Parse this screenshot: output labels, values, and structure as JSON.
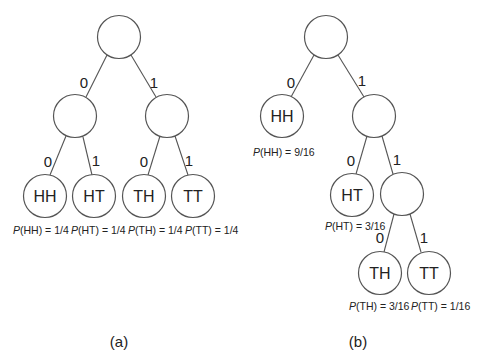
{
  "diagram_a": {
    "caption": "(a)",
    "edges": [
      {
        "label": "0"
      },
      {
        "label": "1"
      },
      {
        "label": "0"
      },
      {
        "label": "1"
      },
      {
        "label": "0"
      },
      {
        "label": "1"
      }
    ],
    "leaves": [
      {
        "label": "HH",
        "prob_p": "P",
        "prob_rest": "(HH) = 1/4"
      },
      {
        "label": "HT",
        "prob_p": "P",
        "prob_rest": "(HT) = 1/4"
      },
      {
        "label": "TH",
        "prob_p": "P",
        "prob_rest": "(TH) = 1/4"
      },
      {
        "label": "TT",
        "prob_p": "P",
        "prob_rest": "(TT) = 1/4"
      }
    ]
  },
  "diagram_b": {
    "caption": "(b)",
    "edges": [
      {
        "label": "0"
      },
      {
        "label": "1"
      },
      {
        "label": "0"
      },
      {
        "label": "1"
      },
      {
        "label": "0"
      },
      {
        "label": "1"
      }
    ],
    "leaves": [
      {
        "label": "HH",
        "prob_p": "P",
        "prob_rest": "(HH) = 9/16"
      },
      {
        "label": "HT",
        "prob_p": "P",
        "prob_rest": "(HT) = 3/16"
      },
      {
        "label": "TH",
        "prob_p": "P",
        "prob_rest": "(TH) = 3/16"
      },
      {
        "label": "TT",
        "prob_p": "P",
        "prob_rest": "(TT) = 1/16"
      }
    ]
  }
}
